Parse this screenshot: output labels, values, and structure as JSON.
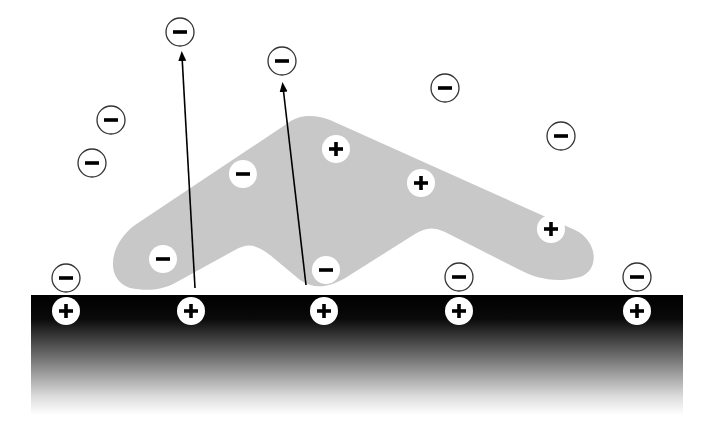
{
  "diagram": {
    "colors": {
      "background": "#ffffff",
      "molecule_fill": "#c8c8c8",
      "surface_top": "#000000",
      "surface_bottom": "#ffffff",
      "ion_stroke": "#333333",
      "glyph": "#000000"
    },
    "surface": {
      "label": "positively charged surface",
      "x": 31,
      "y": 295,
      "width": 652,
      "height": 120,
      "positive_sites": [
        {
          "x": 66,
          "y": 311,
          "sign": "+"
        },
        {
          "x": 191,
          "y": 311,
          "sign": "+"
        },
        {
          "x": 324,
          "y": 311,
          "sign": "+"
        },
        {
          "x": 459,
          "y": 311,
          "sign": "+"
        },
        {
          "x": 637,
          "y": 311,
          "sign": "+"
        }
      ]
    },
    "molecule": {
      "label": "adsorbing polyelectrolyte",
      "bound_charges": [
        {
          "x": 163,
          "y": 259,
          "sign": "−"
        },
        {
          "x": 243,
          "y": 174,
          "sign": "−"
        },
        {
          "x": 326,
          "y": 270,
          "sign": "−"
        },
        {
          "x": 336,
          "y": 149,
          "sign": "+"
        },
        {
          "x": 421,
          "y": 183,
          "sign": "+"
        },
        {
          "x": 551,
          "y": 229,
          "sign": "+"
        }
      ]
    },
    "counterions": {
      "label": "free counterions",
      "ions": [
        {
          "x": 180,
          "y": 32,
          "sign": "−"
        },
        {
          "x": 282,
          "y": 61,
          "sign": "−"
        },
        {
          "x": 111,
          "y": 120,
          "sign": "−"
        },
        {
          "x": 92,
          "y": 163,
          "sign": "−"
        },
        {
          "x": 445,
          "y": 88,
          "sign": "−"
        },
        {
          "x": 561,
          "y": 136,
          "sign": "−"
        },
        {
          "x": 66,
          "y": 278,
          "sign": "−"
        },
        {
          "x": 459,
          "y": 277,
          "sign": "−"
        },
        {
          "x": 637,
          "y": 277,
          "sign": "−"
        }
      ]
    },
    "arrows": {
      "label": "counterion release",
      "items": [
        {
          "x1": 195,
          "y1": 288,
          "x2": 182,
          "y2": 56
        },
        {
          "x1": 306,
          "y1": 285,
          "x2": 283,
          "y2": 87
        }
      ]
    }
  }
}
